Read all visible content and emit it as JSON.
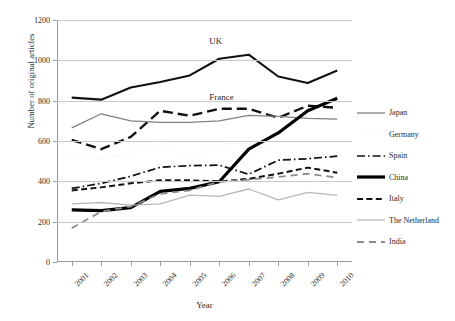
{
  "chart_data": {
    "type": "line",
    "title": "",
    "xlabel": "Year",
    "ylabel": "Number of original articles",
    "categories": [
      "2001",
      "2002",
      "2003",
      "2004",
      "2005",
      "2006",
      "2007",
      "2008",
      "2009",
      "2010"
    ],
    "ylim": [
      0,
      1200
    ],
    "yticks": [
      0,
      200,
      400,
      600,
      800,
      1000,
      1200
    ],
    "grid": true,
    "legend_position": "right",
    "annotations": [
      {
        "text": "UK",
        "x": "2006",
        "y": 1090
      },
      {
        "text": "France",
        "x": "2006",
        "y": 815
      }
    ],
    "series": [
      {
        "name": "UK",
        "style": "solid-black",
        "color": "#111111",
        "width": 2.1,
        "labelled_inline": true,
        "in_legend": false,
        "values": [
          815,
          805,
          865,
          893,
          925,
          1008,
          1028,
          920,
          888,
          950
        ]
      },
      {
        "name": "France",
        "style": "long-dash",
        "color": "#111111",
        "width": 2.4,
        "labelled_inline": true,
        "in_legend": false,
        "values": [
          605,
          560,
          620,
          750,
          725,
          760,
          760,
          715,
          775,
          765
        ]
      },
      {
        "name": "Japan",
        "style": "solid-gray",
        "color": "#808080",
        "width": 1.3,
        "labelled_inline": false,
        "in_legend": true,
        "values": [
          665,
          735,
          700,
          692,
          692,
          700,
          727,
          722,
          712,
          708
        ]
      },
      {
        "name": "Germany",
        "style": "dotted",
        "color": "#7a7a7a",
        "width": 1.6,
        "labelled_inline": false,
        "in_legend": true,
        "values": [
          535,
          508,
          545,
          598,
          515,
          585,
          587,
          540,
          542,
          520
        ]
      },
      {
        "name": "Spain",
        "style": "dash-dot",
        "color": "#111111",
        "width": 1.7,
        "labelled_inline": false,
        "in_legend": true,
        "values": [
          365,
          390,
          425,
          470,
          478,
          480,
          435,
          505,
          512,
          525
        ]
      },
      {
        "name": "China",
        "style": "solid-thick",
        "color": "#000000",
        "width": 3.2,
        "labelled_inline": false,
        "in_legend": true,
        "values": [
          258,
          255,
          270,
          350,
          365,
          398,
          560,
          640,
          750,
          812
        ]
      },
      {
        "name": "Italy",
        "style": "dashed",
        "color": "#111111",
        "width": 2.0,
        "labelled_inline": false,
        "in_legend": true,
        "values": [
          355,
          370,
          390,
          405,
          405,
          400,
          412,
          438,
          468,
          443
        ]
      },
      {
        "name": "The Netherland",
        "style": "solid-lightgray",
        "color": "#b8b8b8",
        "width": 1.3,
        "labelled_inline": false,
        "in_legend": true,
        "values": [
          288,
          295,
          282,
          288,
          332,
          325,
          362,
          308,
          345,
          330
        ]
      },
      {
        "name": "India",
        "style": "med-dash",
        "color": "#8c8c8c",
        "width": 1.8,
        "labelled_inline": false,
        "in_legend": true,
        "values": [
          168,
          250,
          275,
          338,
          355,
          398,
          408,
          422,
          438,
          418
        ]
      }
    ]
  },
  "legend": {
    "items": [
      {
        "label": "Japan",
        "swatch": "solid-gray-line-icon"
      },
      {
        "label": "Germany",
        "swatch": "dotted-line-icon"
      },
      {
        "label": "Spain",
        "swatch": "dash-dot-line-icon"
      },
      {
        "label": "China",
        "swatch": "thick-solid-line-icon"
      },
      {
        "label": "Italy",
        "swatch": "dashed-line-icon"
      },
      {
        "label": "The Netherland",
        "swatch": "solid-lightgray-line-icon"
      },
      {
        "label": "India",
        "swatch": "long-dash-gray-line-icon"
      }
    ]
  }
}
